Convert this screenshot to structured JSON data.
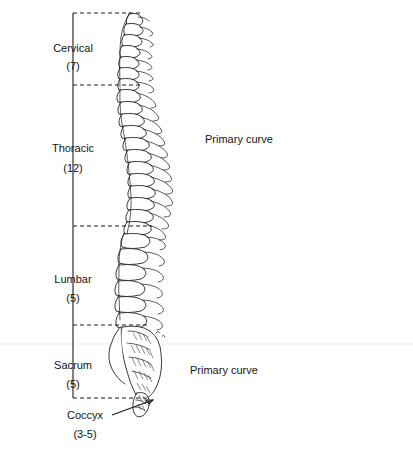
{
  "figure": {
    "background_color": "#ffffff",
    "ink_color": "#1a1a1a"
  },
  "regions": [
    {
      "id": "cervical",
      "label": "Cervical",
      "count": "(7)",
      "label_x": 73,
      "label_y": 52,
      "count_y": 70,
      "bracket_top": 13,
      "bracket_bottom": 85,
      "dash_y_top": 13,
      "dash_y_bottom": 85,
      "dash_x_end": 140
    },
    {
      "id": "thoracic",
      "label": "Thoracic",
      "count": "(12)",
      "label_x": 73,
      "label_y": 152,
      "count_y": 172,
      "bracket_top": 85,
      "bracket_bottom": 226,
      "dash_y_top": 85,
      "dash_y_bottom": 226,
      "dash_x_end": 152
    },
    {
      "id": "lumbar",
      "label": "Lumbar",
      "count": "(5)",
      "label_x": 73,
      "label_y": 283,
      "count_y": 302,
      "bracket_top": 226,
      "bracket_bottom": 325,
      "dash_y_top": 226,
      "dash_y_bottom": 325,
      "dash_x_end": 150
    },
    {
      "id": "sacrum",
      "label": "Sacrum",
      "count": "(5)",
      "label_x": 73,
      "label_y": 369,
      "count_y": 388,
      "bracket_top": 325,
      "bracket_bottom": 398,
      "dash_y_top": 325,
      "dash_y_bottom": 398,
      "dash_x_end": 150
    }
  ],
  "callouts": [
    {
      "id": "coccyx",
      "label": "Coccyx",
      "count": "(3-5)",
      "label_x": 85,
      "label_y": 419,
      "count_x": 85,
      "count_y": 438,
      "leader_from_x": 112,
      "leader_from_y": 415,
      "leader_to_x": 153,
      "leader_to_y": 400
    }
  ],
  "annotations": [
    {
      "id": "primary-curve-thoracic",
      "label": "Primary curve",
      "x": 205,
      "y": 143
    },
    {
      "id": "primary-curve-sacral",
      "label": "Primary curve",
      "x": 190,
      "y": 374
    }
  ],
  "geometry": {
    "bracket_x": 73,
    "spine_top_y": 13,
    "spine_bottom_y": 418,
    "scan_line_y": 344
  }
}
